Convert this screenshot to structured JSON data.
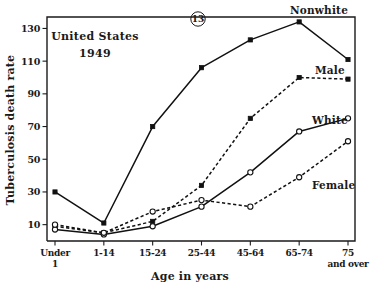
{
  "figure": {
    "number_label": "13",
    "annotation_line1": "United States",
    "annotation_line2": "1949"
  },
  "chart_data": {
    "type": "line",
    "title": "",
    "xlabel": "Age in years",
    "ylabel": "Tuberculosis death rate",
    "categories": [
      "Under 1",
      "1-14",
      "15-24",
      "25-44",
      "45-64",
      "65-74",
      "75 and over"
    ],
    "category_lines": [
      [
        "Under",
        "1"
      ],
      [
        "1-14",
        ""
      ],
      [
        "15-24",
        ""
      ],
      [
        "25-44",
        ""
      ],
      [
        "45-64",
        ""
      ],
      [
        "65-74",
        ""
      ],
      [
        "75",
        "and over"
      ]
    ],
    "ylim": [
      0,
      137
    ],
    "yticks": [
      10,
      30,
      50,
      70,
      90,
      110,
      130
    ],
    "ytick_labels": [
      "10",
      "30",
      "50",
      "70",
      "90",
      "110",
      "130"
    ],
    "grid": false,
    "legend_position": "inline-right",
    "series": [
      {
        "name": "Nonwhite",
        "label": "Nonwhite",
        "style": "solid",
        "marker": "filled",
        "values": [
          30,
          11,
          70,
          106,
          123,
          134,
          111
        ]
      },
      {
        "name": "Male",
        "label": "Male",
        "style": "dashed",
        "marker": "filled",
        "values": [
          9,
          5,
          12,
          34,
          75,
          100,
          99
        ]
      },
      {
        "name": "White",
        "label": "White",
        "style": "solid",
        "marker": "open",
        "values": [
          7,
          4,
          9,
          21,
          42,
          67,
          75
        ]
      },
      {
        "name": "Female",
        "label": "Female",
        "style": "dashed",
        "marker": "open",
        "values": [
          10,
          5,
          18,
          25,
          21,
          39,
          61
        ]
      }
    ]
  }
}
